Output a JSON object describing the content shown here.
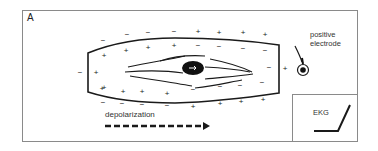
{
  "figure": {
    "panel_letter": "A",
    "electrode_label_line1": "positive",
    "electrode_label_line2": "electrode",
    "ekg_label": "EKG",
    "depolarization_label": "depolarization"
  },
  "icons": {
    "electrode": "circle-dot-icon",
    "arrow": "dashed-arrow-right-icon",
    "ekg_trace": "ekg-upstroke-icon",
    "nucleus": "nucleus-ellipse-icon"
  },
  "colors": {
    "ink": "#1a1a1a",
    "frame": "#8a8a8a",
    "background": "#ffffff"
  },
  "signs": {
    "outer_top": [
      {
        "x": 103,
        "y": 41,
        "t": "−"
      },
      {
        "x": 127,
        "y": 35,
        "t": "−"
      },
      {
        "x": 148,
        "y": 33,
        "t": "−"
      },
      {
        "x": 174,
        "y": 32,
        "t": "−"
      },
      {
        "x": 198,
        "y": 32,
        "t": "+"
      },
      {
        "x": 219,
        "y": 33,
        "t": "+"
      },
      {
        "x": 243,
        "y": 33,
        "t": "+"
      },
      {
        "x": 265,
        "y": 35,
        "t": "+"
      }
    ],
    "inner_top": [
      {
        "x": 104,
        "y": 56,
        "t": "+"
      },
      {
        "x": 126,
        "y": 51,
        "t": "+"
      },
      {
        "x": 148,
        "y": 48,
        "t": "+"
      },
      {
        "x": 174,
        "y": 46,
        "t": "+"
      },
      {
        "x": 198,
        "y": 46,
        "t": "−"
      },
      {
        "x": 219,
        "y": 47,
        "t": "−"
      },
      {
        "x": 243,
        "y": 49,
        "t": "−"
      },
      {
        "x": 265,
        "y": 51,
        "t": "−"
      }
    ],
    "inner_left": [
      {
        "x": 96,
        "y": 73,
        "t": "+"
      },
      {
        "x": 102,
        "y": 89,
        "t": "+"
      }
    ],
    "outer_left": [
      {
        "x": 80,
        "y": 73,
        "t": "−"
      }
    ],
    "inner_bottom": [
      {
        "x": 104,
        "y": 88,
        "t": "+"
      },
      {
        "x": 123,
        "y": 92,
        "t": "+"
      },
      {
        "x": 142,
        "y": 92,
        "t": "+"
      },
      {
        "x": 167,
        "y": 94,
        "t": "+"
      },
      {
        "x": 193,
        "y": 90,
        "t": "−"
      },
      {
        "x": 220,
        "y": 87,
        "t": "−"
      },
      {
        "x": 240,
        "y": 86,
        "t": "−"
      },
      {
        "x": 262,
        "y": 83,
        "t": "−"
      }
    ],
    "outer_bottom": [
      {
        "x": 103,
        "y": 103,
        "t": "−"
      },
      {
        "x": 122,
        "y": 104,
        "t": "−"
      },
      {
        "x": 142,
        "y": 105,
        "t": "−"
      },
      {
        "x": 167,
        "y": 106,
        "t": "−"
      },
      {
        "x": 193,
        "y": 107,
        "t": "+"
      },
      {
        "x": 220,
        "y": 104,
        "t": "+"
      },
      {
        "x": 241,
        "y": 102,
        "t": "+"
      },
      {
        "x": 263,
        "y": 100,
        "t": "+"
      }
    ],
    "right": [
      {
        "x": 269,
        "y": 68,
        "t": "−"
      },
      {
        "x": 285,
        "y": 69,
        "t": "+"
      }
    ]
  }
}
